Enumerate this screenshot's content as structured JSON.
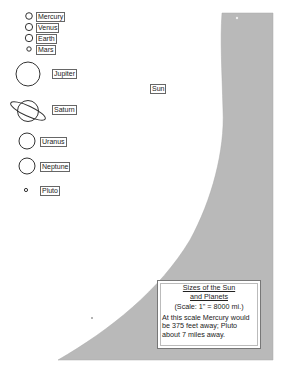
{
  "colors": {
    "sun_fill": "#b9b9b9",
    "planet_stroke": "#333333",
    "background": "#ffffff"
  },
  "sun": {
    "label": "Sun"
  },
  "planets": [
    {
      "name": "Mercury",
      "size": "small"
    },
    {
      "name": "Venus",
      "size": "small"
    },
    {
      "name": "Earth",
      "size": "small"
    },
    {
      "name": "Mars",
      "size": "tiny"
    },
    {
      "name": "Jupiter",
      "size": "large"
    },
    {
      "name": "Saturn",
      "size": "large-ringed"
    },
    {
      "name": "Uranus",
      "size": "medium"
    },
    {
      "name": "Neptune",
      "size": "medium"
    },
    {
      "name": "Pluto",
      "size": "tiny"
    }
  ],
  "caption": {
    "title_line1": "Sizes of the Sun",
    "title_line2": "and Planets",
    "scale": "(Scale: 1\" = 8000 mi.)",
    "body": "At this scale Mercury would be 375 feet away; Pluto about 7 miles away."
  }
}
